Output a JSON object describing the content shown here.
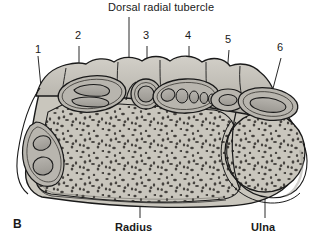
{
  "figure": {
    "panel_label": "B",
    "title_label": "Dorsal radial tubercle",
    "caption_type": "cross-sectional anatomical illustration of the distal forearm showing the six dorsal extensor compartments",
    "anatomy_labels": [
      {
        "id": "radius",
        "text": "Radius"
      },
      {
        "id": "ulna",
        "text": "Ulna"
      }
    ],
    "compartment_numbers": [
      {
        "id": "compartment-1",
        "text": "1"
      },
      {
        "id": "compartment-2",
        "text": "2"
      },
      {
        "id": "compartment-3",
        "text": "3"
      },
      {
        "id": "compartment-4",
        "text": "4"
      },
      {
        "id": "compartment-5",
        "text": "5"
      },
      {
        "id": "compartment-6",
        "text": "6"
      }
    ],
    "colors": {
      "background": "#ffffff",
      "ink": "#1a1a1a",
      "bone_fill": "#c9c6bd",
      "bone_stipple": "#4a4743",
      "retinaculum_fill": "#bfbcb4",
      "tendon_fill": "#a9a6a0",
      "cortex_fill": "#dedbd4",
      "leader_line": "#2a2a2a"
    }
  }
}
